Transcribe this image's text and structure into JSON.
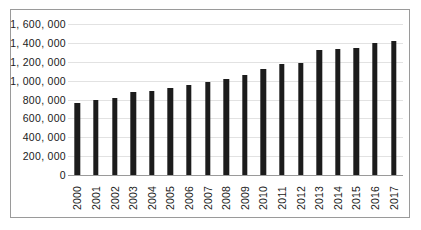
{
  "chart_data": {
    "type": "bar",
    "title": "",
    "subtitle": "",
    "xlabel": "",
    "ylabel": "",
    "categories": [
      "2000",
      "2001",
      "2002",
      "2003",
      "2004",
      "2005",
      "2006",
      "2007",
      "2008",
      "2009",
      "2010",
      "2011",
      "2012",
      "2013",
      "2014",
      "2015",
      "2016",
      "2017"
    ],
    "values": [
      760000,
      790000,
      815000,
      880000,
      895000,
      925000,
      955000,
      990000,
      1020000,
      1065000,
      1125000,
      1175000,
      1190000,
      1320000,
      1340000,
      1350000,
      1395000,
      1425000
    ],
    "series": [
      {
        "name": "",
        "values": [
          760000,
          790000,
          815000,
          880000,
          895000,
          925000,
          955000,
          990000,
          1020000,
          1065000,
          1125000,
          1175000,
          1190000,
          1320000,
          1340000,
          1350000,
          1395000,
          1425000
        ]
      }
    ],
    "ylim": [
      0,
      1600000
    ],
    "y_ticks": [
      0,
      200000,
      400000,
      600000,
      800000,
      1000000,
      1200000,
      1400000,
      1600000
    ],
    "y_tick_labels": [
      "0",
      "200, 000",
      "400, 000",
      "600, 000",
      "800, 000",
      "1, 000, 000",
      "1, 200, 000",
      "1, 400, 000",
      "1, 600, 000"
    ],
    "grid": true,
    "legend": "none",
    "bar_color": "#1c1c1c",
    "gridline_color": "#e2e2e2",
    "axis_color": "#9a9a9a",
    "background_color": "#ffffff",
    "x_tick_rotation": "90"
  }
}
